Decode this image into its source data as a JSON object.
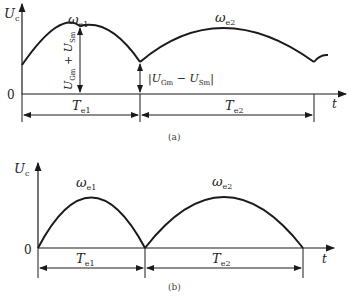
{
  "figure_a": {
    "y_axis": {
      "label": "U",
      "sub": "c"
    },
    "x_axis": {
      "label": "t"
    },
    "origin": "0",
    "arc1": {
      "label": "ω",
      "sub": "e1"
    },
    "arc2": {
      "label": "ω",
      "sub": "e2"
    },
    "peak_amplitude": {
      "text": "U",
      "sub1": "Gm",
      "plus": " + U",
      "sub2": "Sm"
    },
    "valley_amplitude": {
      "text": "|U",
      "sub1": "Gm",
      "minus": " − U",
      "sub2": "Sm",
      "close": "|"
    },
    "period1": {
      "label": "T",
      "sub": "e1"
    },
    "period2": {
      "label": "T",
      "sub": "e2"
    },
    "caption": "(a)"
  },
  "figure_b": {
    "y_axis": {
      "label": "U",
      "sub": "c"
    },
    "x_axis": {
      "label": "t"
    },
    "origin": "0",
    "arc1": {
      "label": "ω",
      "sub": "e1"
    },
    "arc2": {
      "label": "ω",
      "sub": "e2"
    },
    "period1": {
      "label": "T",
      "sub": "e1"
    },
    "period2": {
      "label": "T",
      "sub": "e2"
    },
    "caption": "(b)"
  },
  "colors": {
    "stroke": "#1a1a1a",
    "text": "#222222"
  }
}
